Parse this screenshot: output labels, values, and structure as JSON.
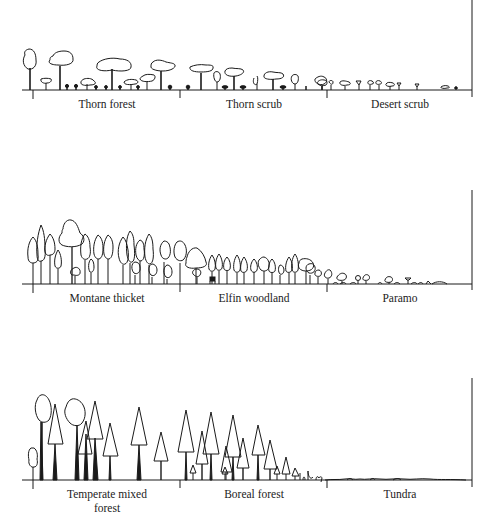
{
  "diagram": {
    "type": "vegetation-profile-transects",
    "stroke_color": "#1a1a1a",
    "background": "#ffffff",
    "panels": [
      {
        "id": "dry-gradient",
        "zones": [
          {
            "label": "Thorn forest",
            "x_center": 107
          },
          {
            "label": "Thorn scrub",
            "x_center": 254
          },
          {
            "label": "Desert scrub",
            "x_center": 400
          }
        ]
      },
      {
        "id": "montane-gradient",
        "zones": [
          {
            "label": "Montane thicket",
            "x_center": 107
          },
          {
            "label": "Elfin woodland",
            "x_center": 254
          },
          {
            "label": "Paramo",
            "x_center": 400
          }
        ]
      },
      {
        "id": "latitudinal-gradient",
        "zones": [
          {
            "label": "Temperate mixed\nforest",
            "x_center": 107
          },
          {
            "label": "Boreal forest",
            "x_center": 254
          },
          {
            "label": "Tundra",
            "x_center": 400
          }
        ]
      }
    ]
  }
}
